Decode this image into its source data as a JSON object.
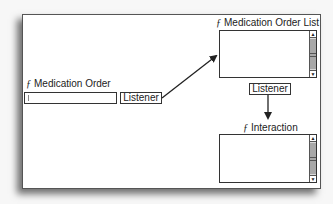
{
  "diagram": {
    "nodes": {
      "medication_order": {
        "label": "Medication Order",
        "fn_symbol": "ƒ",
        "type": "text-field"
      },
      "medication_order_list": {
        "label": "Medication Order List",
        "fn_symbol": "ƒ",
        "type": "list-box"
      },
      "interaction": {
        "label": "Interaction",
        "fn_symbol": "ƒ",
        "type": "list-box"
      }
    },
    "listeners": [
      {
        "label": "Listener",
        "from": "medication_order",
        "to": "medication_order_list"
      },
      {
        "label": "Listener",
        "from": "medication_order_list",
        "to": "interaction"
      }
    ],
    "scroll_icons": {
      "up": "▲",
      "down": "▼"
    },
    "colors": {
      "line": "#333333",
      "scroll_track": "#d9d9d9",
      "scroll_thumb": "#a8a8a8"
    }
  }
}
